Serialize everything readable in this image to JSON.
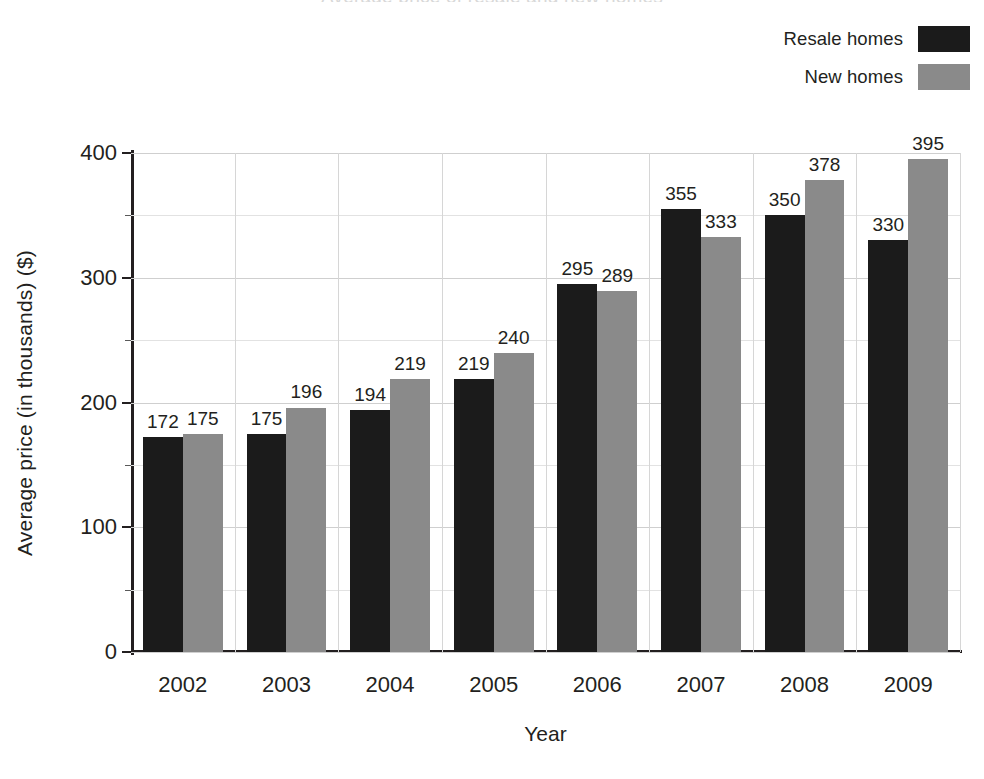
{
  "chart_data": {
    "type": "bar",
    "title": "Average price of resale and new homes",
    "xlabel": "Year",
    "ylabel": "Average price (in thousands) ($)",
    "categories": [
      "2002",
      "2003",
      "2004",
      "2005",
      "2006",
      "2007",
      "2008",
      "2009"
    ],
    "series": [
      {
        "name": "Resale homes",
        "color": "#1b1b1b",
        "values": [
          172,
          175,
          194,
          219,
          295,
          355,
          350,
          330
        ]
      },
      {
        "name": "New homes",
        "color": "#8a8a8a",
        "values": [
          175,
          196,
          219,
          240,
          289,
          333,
          378,
          395
        ]
      }
    ],
    "ylim": [
      0,
      400
    ],
    "yticks": [
      0,
      100,
      200,
      300,
      400
    ],
    "ytick_labels": [
      "0",
      "100",
      "200",
      "300",
      "400"
    ],
    "yminor_ticks": [
      50,
      150,
      250,
      350
    ],
    "grid": true,
    "legend_position": "top-right"
  },
  "legend": {
    "items": [
      {
        "label": "Resale homes",
        "swatch": "black-swatch"
      },
      {
        "label": "New homes",
        "swatch": "gray-swatch"
      }
    ]
  },
  "axes": {
    "y_title": "Average price (in thousands) ($)",
    "x_title": "Year"
  }
}
